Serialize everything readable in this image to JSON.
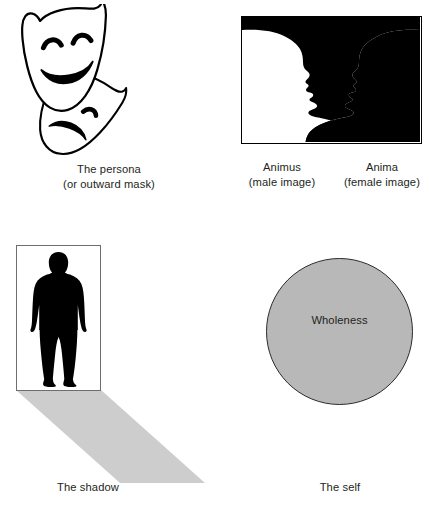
{
  "figure": {
    "background_color": "#ffffff",
    "text_color": "#231f20"
  },
  "panels": [
    {
      "id": "persona",
      "name": "the-persona",
      "art": "theatre-masks",
      "art_description": "comedy mask and tragedy mask overlapping",
      "caption_lines": [
        "The persona",
        "(or outward mask)"
      ]
    },
    {
      "id": "animus-anima",
      "name": "animus-anima",
      "art": "rubin-face-vase-illusion",
      "art_description": "black vase silhouette forming two facing white profiles inside a black bordered rectangle",
      "border_color": "#000000",
      "fill_color": "#000000",
      "captions": [
        {
          "lines": [
            "Animus",
            "(male image)"
          ]
        },
        {
          "lines": [
            "Anima",
            "(female image)"
          ]
        }
      ]
    },
    {
      "id": "shadow",
      "name": "the-shadow",
      "art": "person-silhouette-with-cast-shadow",
      "art_description": "black standing human silhouette inside a thin grey bordered box with a long grey shadow cast down and to the right",
      "border_color": "#6d6e70",
      "figure_color": "#000000",
      "shadow_color": "#cdcdcd",
      "caption_lines": [
        "The shadow"
      ]
    },
    {
      "id": "self",
      "name": "the-self",
      "art": "grey-circle",
      "art_description": "large grey circle outlined in black containing a centred label",
      "circle_fill": "#b8b8b8",
      "circle_stroke": "#2b2b2b",
      "inner_label": "Wholeness",
      "caption_lines": [
        "The self"
      ]
    }
  ]
}
